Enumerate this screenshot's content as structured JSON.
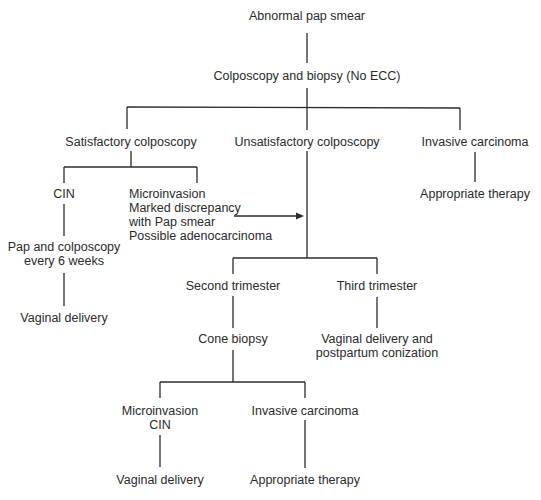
{
  "diagram": {
    "type": "flowchart",
    "nodes": {
      "root": "Abnormal pap smear",
      "colposcopy": "Colposcopy and biopsy (No ECC)",
      "satisfactory": "Satisfactory colposcopy",
      "unsatisfactory": "Unsatisfactory colposcopy",
      "invasive_top": "Invasive carcinoma",
      "therapy_top": "Appropriate therapy",
      "cin": "CIN",
      "pap_colpo_line1": "Pap and colposcopy",
      "pap_colpo_line2": "every 6 weeks",
      "vaginal_delivery_left": "Vaginal delivery",
      "micro_line1": "Microinvasion",
      "micro_line2": "Marked discrepancy",
      "micro_line3": "with Pap smear",
      "micro_line4": "Possible adenocarcinoma",
      "second_trimester": "Second trimester",
      "third_trimester": "Third trimester",
      "cone_biopsy": "Cone biopsy",
      "vd_postpartum_line1": "Vaginal delivery and",
      "vd_postpartum_line2": "postpartum conization",
      "micro_cin_line1": "Microinvasion",
      "micro_cin_line2": "CIN",
      "invasive_bottom": "Invasive carcinoma",
      "vaginal_delivery_bottom": "Vaginal delivery",
      "therapy_bottom": "Appropriate therapy"
    },
    "edges": [
      [
        "root",
        "colposcopy"
      ],
      [
        "colposcopy",
        "satisfactory"
      ],
      [
        "colposcopy",
        "unsatisfactory"
      ],
      [
        "colposcopy",
        "invasive_top"
      ],
      [
        "invasive_top",
        "therapy_top"
      ],
      [
        "satisfactory",
        "cin"
      ],
      [
        "satisfactory",
        "micro"
      ],
      [
        "cin",
        "pap_colpo"
      ],
      [
        "pap_colpo",
        "vaginal_delivery_left"
      ],
      [
        "micro",
        "unsatisfactory",
        "arrow"
      ],
      [
        "unsatisfactory",
        "second_trimester"
      ],
      [
        "unsatisfactory",
        "third_trimester"
      ],
      [
        "second_trimester",
        "cone_biopsy"
      ],
      [
        "third_trimester",
        "vd_postpartum"
      ],
      [
        "cone_biopsy",
        "micro_cin"
      ],
      [
        "cone_biopsy",
        "invasive_bottom"
      ],
      [
        "micro_cin",
        "vaginal_delivery_bottom"
      ],
      [
        "invasive_bottom",
        "therapy_bottom"
      ]
    ],
    "line_color": "#2b2b2b",
    "text_color": "#2a2a2a"
  }
}
